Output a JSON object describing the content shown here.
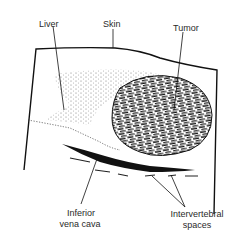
{
  "diagram": {
    "type": "anatomical ultrasound sketch",
    "labels": {
      "liver": "Liver",
      "skin": "Skin",
      "tumor": "Tumor",
      "ivc_line1": "Inferior",
      "ivc_line2": "vena cava",
      "iv_line1": "Intervertebral",
      "iv_line2": "spaces"
    },
    "colors": {
      "ink": "#111111",
      "background": "#ffffff"
    }
  }
}
